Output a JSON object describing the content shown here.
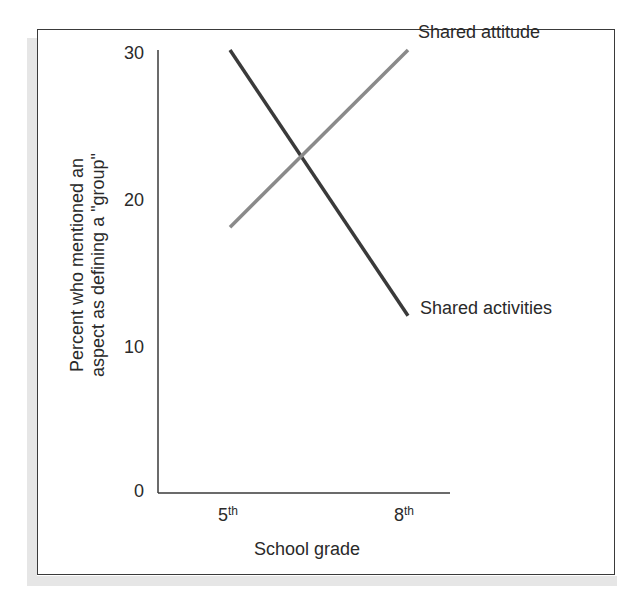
{
  "chart_data": {
    "type": "line",
    "title": "",
    "xlabel": "School grade",
    "ylabel": "Percent who mentioned an aspect as defining a \"group\"",
    "ylabel_lines": [
      "Percent who mentioned an",
      "aspect as defining a \"group\""
    ],
    "x": [
      "5th",
      "8th"
    ],
    "x_ticks": [
      {
        "base": "5",
        "sup": "th"
      },
      {
        "base": "8",
        "sup": "th"
      }
    ],
    "y_ticks": [
      "0",
      "10",
      "20",
      "30"
    ],
    "ylim": [
      0,
      30
    ],
    "grid": false,
    "legend_position": "inline-right-of-line-ends",
    "series": [
      {
        "name": "Shared activities",
        "values": [
          30,
          12
        ],
        "color": "#3a3a3a"
      },
      {
        "name": "Shared attitude",
        "values": [
          18,
          30
        ],
        "color": "#8a8a8a"
      }
    ]
  },
  "colors": {
    "frame": "#3a3a3a",
    "axis": "#3a3a3a",
    "shadow": "#e6e6e6",
    "activities_line": "#3a3a3a",
    "attitude_line": "#8a8a8a"
  }
}
